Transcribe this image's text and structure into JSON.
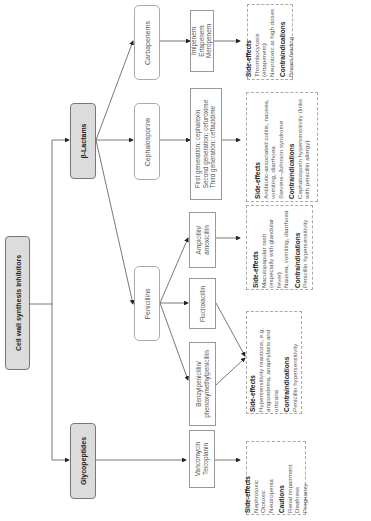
{
  "root": {
    "label": "Cell wall synthesis inhibitors"
  },
  "groups": {
    "beta_lactams": {
      "label": "β-Lactams"
    },
    "glycopeptides": {
      "label": "Glycopeptides"
    }
  },
  "classes": {
    "carbapenems": {
      "label": "Carbapenems"
    },
    "cephalosporins": {
      "label": "Cephalosporins"
    },
    "penicillins": {
      "label": "Penicillins"
    }
  },
  "drugs": {
    "carbapenems": [
      "Imipenem",
      "Ertapenem",
      "Meropenem"
    ],
    "cephalosporins": [
      "First generation: cephalexin",
      "Second generation: cefuroxime",
      "Third generation: ceftazidime"
    ],
    "ampicillin": [
      "Ampicillin/",
      "amoxicillin"
    ],
    "flucloxacillin": [
      "Flucloxacillin"
    ],
    "benzylpenicillin": [
      "Benzylpenicillin/",
      "phenoxymethylpenicillin"
    ],
    "glycopeptides": [
      "Vancomycin",
      "Teicoplanin"
    ]
  },
  "notes": {
    "carbapenems": {
      "sections": [
        {
          "heading": "Side-effects",
          "items": [
            "Thrombocytosis (ertapenem)",
            "Neurotoxic at high doses"
          ]
        },
        {
          "heading": "Contraindications",
          "items": [
            "Breast-feeding"
          ]
        }
      ]
    },
    "cephalosporins": {
      "sections": [
        {
          "heading": "Side-effects",
          "items": [
            "Antibiotic-associated colitis, nausea, vomiting, diarrhoea",
            "Stevens–Johnson syndrome"
          ]
        },
        {
          "heading": "Contraindications",
          "items": [
            "Cephalosporin hypersensitivity (links with penicillin allergy)"
          ]
        }
      ]
    },
    "ampicillin": {
      "sections": [
        {
          "heading": "Side-effects",
          "items": [
            "Maculopapular rash (especially with glandular fever)",
            "Nausea, vomiting, diarrhoea"
          ]
        },
        {
          "heading": "Contraindications",
          "items": [
            "Penicillin hypersensitivity"
          ]
        }
      ]
    },
    "penicillins_common": {
      "sections": [
        {
          "heading": "Side-effects",
          "items": [
            "Hypersensitivity reactions, e.g. angioedema, anaphylaxis and urticaria"
          ]
        },
        {
          "heading": "Contraindications",
          "items": [
            "Penicillin hypersensitivity"
          ]
        }
      ]
    },
    "glycopeptides": {
      "sections": [
        {
          "heading": "Side-effects",
          "items": [
            "Nephrotoxic",
            "Ototoxic",
            "Neutropenia"
          ]
        },
        {
          "heading": "Cautions",
          "items": [
            "Renal impairment",
            "Deafness",
            "Pregnancy"
          ]
        }
      ]
    }
  },
  "colors": {
    "root_fill": "#dcdcdc",
    "line": "#444444",
    "dash_border": "#aaaaaa"
  }
}
